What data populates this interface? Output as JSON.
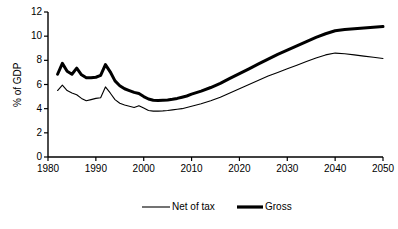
{
  "chart_data": {
    "type": "line",
    "title": "",
    "xlabel": "",
    "ylabel": "% of GDP",
    "xlim": [
      1980,
      2050
    ],
    "ylim": [
      0,
      12
    ],
    "xticks": [
      1980,
      1990,
      2000,
      2010,
      2020,
      2030,
      2040,
      2050
    ],
    "yticks": [
      0,
      2,
      4,
      6,
      8,
      10,
      12
    ],
    "grid": false,
    "legend_position": "bottom",
    "series": [
      {
        "name": "Net of tax",
        "style": "thin",
        "color": "#000000",
        "x": [
          1982,
          1983,
          1984,
          1985,
          1986,
          1987,
          1988,
          1989,
          1990,
          1991,
          1992,
          1993,
          1994,
          1995,
          1996,
          1997,
          1998,
          1999,
          2000,
          2001,
          2002,
          2003,
          2004,
          2005,
          2006,
          2007,
          2008,
          2009,
          2010,
          2012,
          2014,
          2016,
          2018,
          2020,
          2022,
          2024,
          2026,
          2028,
          2030,
          2032,
          2034,
          2036,
          2038,
          2040,
          2042,
          2044,
          2046,
          2048,
          2050
        ],
        "values": [
          5.5,
          5.95,
          5.5,
          5.3,
          5.15,
          4.85,
          4.65,
          4.75,
          4.85,
          4.9,
          5.8,
          5.3,
          4.75,
          4.45,
          4.3,
          4.2,
          4.1,
          4.25,
          4.05,
          3.85,
          3.8,
          3.8,
          3.82,
          3.85,
          3.9,
          3.95,
          4.0,
          4.1,
          4.2,
          4.4,
          4.65,
          4.95,
          5.3,
          5.65,
          6.0,
          6.35,
          6.7,
          7.0,
          7.3,
          7.6,
          7.9,
          8.2,
          8.45,
          8.6,
          8.55,
          8.45,
          8.35,
          8.25,
          8.15
        ]
      },
      {
        "name": "Gross",
        "style": "thick",
        "color": "#000000",
        "x": [
          1982,
          1983,
          1984,
          1985,
          1986,
          1987,
          1988,
          1989,
          1990,
          1991,
          1992,
          1993,
          1994,
          1995,
          1996,
          1997,
          1998,
          1999,
          2000,
          2001,
          2002,
          2003,
          2004,
          2005,
          2006,
          2007,
          2008,
          2009,
          2010,
          2012,
          2014,
          2016,
          2018,
          2020,
          2022,
          2024,
          2026,
          2028,
          2030,
          2032,
          2034,
          2036,
          2038,
          2040,
          2042,
          2044,
          2046,
          2048,
          2050
        ],
        "values": [
          6.85,
          7.75,
          7.1,
          6.85,
          7.35,
          6.8,
          6.55,
          6.55,
          6.6,
          6.75,
          7.65,
          7.05,
          6.3,
          5.9,
          5.65,
          5.5,
          5.35,
          5.25,
          5.0,
          4.8,
          4.7,
          4.68,
          4.7,
          4.72,
          4.78,
          4.85,
          4.95,
          5.05,
          5.2,
          5.45,
          5.75,
          6.1,
          6.5,
          6.9,
          7.3,
          7.7,
          8.1,
          8.5,
          8.85,
          9.2,
          9.55,
          9.9,
          10.2,
          10.45,
          10.55,
          10.62,
          10.68,
          10.74,
          10.8
        ]
      }
    ]
  },
  "legend": {
    "items": [
      {
        "label": "Net of tax",
        "style": "thin"
      },
      {
        "label": "Gross",
        "style": "thick"
      }
    ]
  }
}
